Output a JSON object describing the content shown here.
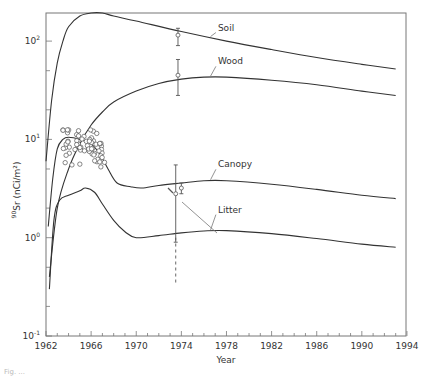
{
  "chart_data": {
    "type": "line",
    "title": "",
    "xlabel": "Year",
    "ylabel_main": "Sr",
    "ylabel_sup": "90",
    "ylabel_rest": " (nCi/m²)",
    "xlim": [
      1962,
      1994
    ],
    "ylim": [
      0.1,
      200
    ],
    "yscale": "log",
    "x_ticks": [
      1962,
      1966,
      1970,
      1974,
      1978,
      1982,
      1986,
      1990,
      1994
    ],
    "y_ticks": [
      {
        "value": 0.1,
        "label": "10",
        "exp": "-1"
      },
      {
        "value": 1,
        "label": "10",
        "exp": "0"
      },
      {
        "value": 10,
        "label": "10",
        "exp": "1"
      },
      {
        "value": 100,
        "label": "10",
        "exp": "2"
      }
    ],
    "grid": false,
    "series": [
      {
        "name": "Soil",
        "x": [
          1962,
          1962.5,
          1963,
          1963.5,
          1964,
          1965,
          1966,
          1967,
          1968,
          1970,
          1974,
          1978,
          1982,
          1986,
          1990,
          1993
        ],
        "values": [
          6,
          25,
          60,
          100,
          140,
          180,
          200,
          195,
          180,
          160,
          125,
          100,
          82,
          68,
          58,
          52
        ],
        "label_pos": [
          1976,
          128
        ]
      },
      {
        "name": "Wood",
        "x": [
          1962.3,
          1963,
          1964,
          1965,
          1966,
          1967,
          1968,
          1970,
          1972,
          1974,
          1976,
          1978,
          1982,
          1986,
          1990,
          1993
        ],
        "values": [
          0.4,
          2,
          5,
          9,
          14,
          19,
          24,
          31,
          37,
          41,
          43,
          43,
          40,
          36,
          31,
          28
        ],
        "label_pos": [
          1976,
          58
        ]
      },
      {
        "name": "Canopy",
        "x": [
          1962.2,
          1962.6,
          1963,
          1963.5,
          1964,
          1965,
          1966,
          1966.8,
          1967.5,
          1968.3,
          1969.5,
          1970.5,
          1972,
          1974,
          1976,
          1978,
          1982,
          1986,
          1990,
          1993
        ],
        "values": [
          1.3,
          4,
          8,
          10,
          10.5,
          10,
          9,
          7,
          5,
          3.6,
          3.3,
          3.2,
          3.4,
          3.6,
          3.8,
          3.8,
          3.5,
          3.1,
          2.7,
          2.5
        ],
        "label_pos": [
          1976,
          5.2
        ]
      },
      {
        "name": "Litter",
        "x": [
          1962.3,
          1962.7,
          1963.2,
          1964,
          1965,
          1965.5,
          1966.3,
          1967,
          1968,
          1969,
          1970,
          1972,
          1974,
          1976,
          1978,
          1982,
          1986,
          1990,
          1993
        ],
        "values": [
          0.3,
          1.5,
          2.4,
          2.7,
          3.0,
          3.2,
          2.9,
          2.2,
          1.5,
          1.15,
          1.0,
          1.05,
          1.12,
          1.17,
          1.18,
          1.1,
          0.98,
          0.86,
          0.8
        ],
        "label_pos": [
          1976,
          1.8
        ]
      }
    ],
    "observations": [
      {
        "name": "Soil obs",
        "x": 1973.7,
        "value": 115,
        "err_low": 90,
        "err_high": 135
      },
      {
        "name": "Wood obs",
        "x": 1973.7,
        "value": 45,
        "err_low": 28,
        "err_high": 65
      },
      {
        "name": "Canopy obs A",
        "x": 1973.5,
        "value": 2.8,
        "err_low": 0.9,
        "err_high": 5.5
      },
      {
        "name": "Canopy obs B",
        "x": 1974.0,
        "value": 3.2,
        "err_low": 2.8,
        "err_high": 3.6
      },
      {
        "name": "Litter obs range",
        "x": 1973.5,
        "value": 1.0,
        "err_low": 0.35,
        "err_high": 1.0,
        "dashed": true
      }
    ],
    "scatter_points_approx": {
      "x_range": [
        1963.5,
        1967.2
      ],
      "y_range": [
        5.5,
        12
      ],
      "count": 60
    }
  },
  "figure_caption": "Fig. ..."
}
